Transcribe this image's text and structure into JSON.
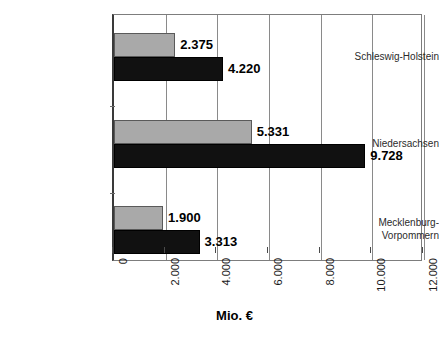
{
  "chart_data": {
    "type": "bar",
    "orientation": "horizontal",
    "title": "",
    "subtitle": "",
    "xlabel": "Mio. €",
    "ylabel": "",
    "xlim": [
      0,
      12000
    ],
    "grid": true,
    "legend": "none",
    "categories": [
      "Schleswig-Holstein",
      "Niedersachsen",
      "Mecklenburg-\nVorpommern"
    ],
    "tick_labels": [
      "0",
      "2.000",
      "4.000",
      "6.000",
      "8.000",
      "10.000",
      "12.000"
    ],
    "tick_values": [
      0,
      2000,
      4000,
      6000,
      8000,
      10000,
      12000
    ],
    "series": [
      {
        "name": "series-1",
        "color": "#a9a9a9",
        "values": [
          2375,
          5331,
          1900
        ],
        "labels": [
          "2.375",
          "5.331",
          "1.900"
        ]
      },
      {
        "name": "series-2",
        "color": "#111111",
        "values": [
          4220,
          9728,
          3313
        ],
        "labels": [
          "4.220",
          "9.728",
          "3.313"
        ]
      }
    ]
  },
  "axis": {
    "title": "Mio. €"
  }
}
